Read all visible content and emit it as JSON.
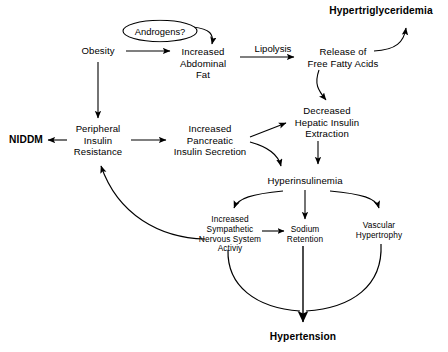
{
  "diagram": {
    "background_color": "#ffffff",
    "line_color": "#000000",
    "width": 448,
    "height": 352,
    "nodes": [
      {
        "id": "androgens",
        "label": "Androgens?",
        "shape": "ellipse",
        "x": 160,
        "y": 31,
        "style": "plain"
      },
      {
        "id": "obesity",
        "label": "Obesity",
        "shape": "text",
        "x": 98,
        "y": 51,
        "style": "plain"
      },
      {
        "id": "abdominal_fat",
        "label": "Increased\nAbdominal\nFat",
        "shape": "text",
        "x": 203,
        "y": 63,
        "style": "plain"
      },
      {
        "id": "hypertrig",
        "label": "Hypertriglyceridemia",
        "shape": "text",
        "x": 381,
        "y": 11,
        "style": "bold"
      },
      {
        "id": "ffa",
        "label": "Release of\nFree Fatty Acids",
        "shape": "text",
        "x": 343,
        "y": 57,
        "style": "plain"
      },
      {
        "id": "hepatic",
        "label": "Decreased\nHepatic Insulin\nExtraction",
        "shape": "text",
        "x": 327,
        "y": 122,
        "style": "plain"
      },
      {
        "id": "niddm",
        "label": "NIDDM",
        "shape": "text",
        "x": 26,
        "y": 140,
        "style": "bold"
      },
      {
        "id": "pir",
        "label": "Peripheral\nInsulin\nResistance",
        "shape": "text",
        "x": 98,
        "y": 140,
        "style": "plain"
      },
      {
        "id": "pancreatic",
        "label": "Increased\nPancreatic\nInsulin Secretion",
        "shape": "text",
        "x": 210,
        "y": 140,
        "style": "plain"
      },
      {
        "id": "hyperinsulinemia",
        "label": "Hyperinsulinemia",
        "shape": "text",
        "x": 305,
        "y": 181,
        "style": "plain"
      },
      {
        "id": "sympathetic",
        "label": "Increased\nSympathetic\nNervous System\nActiviy",
        "shape": "text",
        "x": 230,
        "y": 235,
        "style": "small"
      },
      {
        "id": "sodium",
        "label": "Sodium\nRetention",
        "shape": "text",
        "x": 305,
        "y": 235,
        "style": "small"
      },
      {
        "id": "vascular",
        "label": "Vascular\nHypertrophy",
        "shape": "text",
        "x": 379,
        "y": 231,
        "style": "small"
      },
      {
        "id": "hypertension",
        "label": "Hypertension",
        "shape": "text",
        "x": 303,
        "y": 337,
        "style": "bold"
      }
    ],
    "edge_labels": [
      {
        "id": "lipolysis",
        "label": "Lipolysis",
        "x": 273,
        "y": 48
      }
    ],
    "edges": [
      {
        "from": "androgens",
        "to": "abdominal_fat",
        "type": "curve"
      },
      {
        "from": "obesity",
        "to": "abdominal_fat",
        "type": "straight"
      },
      {
        "from": "obesity",
        "to": "pir",
        "type": "straight"
      },
      {
        "from": "abdominal_fat",
        "to": "ffa",
        "type": "straight",
        "label": "Lipolysis"
      },
      {
        "from": "ffa",
        "to": "hypertrig",
        "type": "curve"
      },
      {
        "from": "ffa",
        "to": "hepatic",
        "type": "curve"
      },
      {
        "from": "pir",
        "to": "niddm",
        "type": "straight"
      },
      {
        "from": "pir",
        "to": "pancreatic",
        "type": "straight"
      },
      {
        "from": "pancreatic",
        "to": "hepatic",
        "type": "straight"
      },
      {
        "from": "pancreatic",
        "to": "hyperinsulinemia",
        "type": "curve"
      },
      {
        "from": "hepatic",
        "to": "hyperinsulinemia",
        "type": "straight"
      },
      {
        "from": "hyperinsulinemia",
        "to": "sympathetic",
        "type": "curve"
      },
      {
        "from": "hyperinsulinemia",
        "to": "sodium",
        "type": "straight"
      },
      {
        "from": "hyperinsulinemia",
        "to": "vascular",
        "type": "curve"
      },
      {
        "from": "sympathetic",
        "to": "sodium",
        "type": "straight"
      },
      {
        "from": "sympathetic",
        "to": "hypertension",
        "type": "curve"
      },
      {
        "from": "sodium",
        "to": "hypertension",
        "type": "straight"
      },
      {
        "from": "vascular",
        "to": "hypertension",
        "type": "curve"
      },
      {
        "from": "sympathetic",
        "to": "pir",
        "type": "feedback-curve"
      }
    ]
  }
}
